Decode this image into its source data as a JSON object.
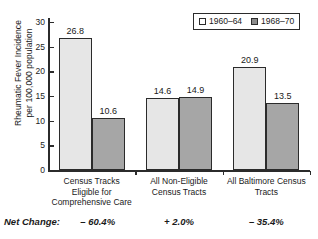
{
  "chart_data": {
    "type": "bar",
    "title": "",
    "xlabel": "",
    "ylabel": "Rheumatic Fever Incidence\nper 100,000 population",
    "ylim": [
      0,
      30
    ],
    "yticks": [
      0,
      5,
      10,
      15,
      20,
      25,
      30
    ],
    "ytick_labels": [
      "0",
      "5",
      "10",
      "15",
      "20",
      "25",
      "30"
    ],
    "grid": false,
    "legend_position": "top-right",
    "categories": [
      "Census Tracks\nEligible for\nComprehensive Care",
      "All Non-Eligible\nCensus Tracts",
      "All Baltimore Census\nTracts"
    ],
    "series": [
      {
        "name": "1960–64",
        "values": [
          26.8,
          14.6,
          20.9
        ],
        "color": "#e6e6e6"
      },
      {
        "name": "1968–70",
        "values": [
          10.6,
          14.9,
          13.5
        ],
        "color": "#a6a6a6"
      }
    ],
    "data_labels": [
      [
        "26.8",
        "10.6"
      ],
      [
        "14.6",
        "14.9"
      ],
      [
        "20.9",
        "13.5"
      ]
    ],
    "annotations": {
      "net_change_label": "Net Change:",
      "net_change_values": [
        "– 60.4%",
        "+ 2.0%",
        "– 35.4%"
      ]
    }
  },
  "legend": {
    "entries": [
      {
        "label": "1960–64",
        "swatch": "light"
      },
      {
        "label": "1968–70",
        "swatch": "dark"
      }
    ]
  }
}
